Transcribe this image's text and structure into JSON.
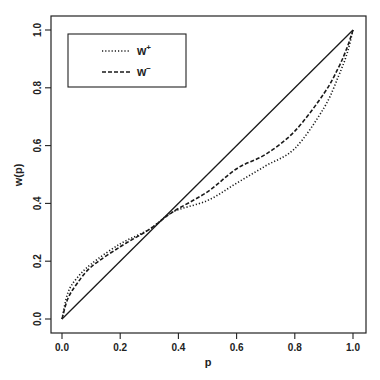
{
  "chart_data": {
    "type": "line",
    "title": "",
    "xlabel": "p",
    "ylabel": "w(p)",
    "xlim": [
      0.0,
      1.0
    ],
    "ylim": [
      0.0,
      1.0
    ],
    "x_ticks": [
      "0.0",
      "0.2",
      "0.4",
      "0.6",
      "0.8",
      "1.0"
    ],
    "y_ticks": [
      "0.0",
      "0.2",
      "0.4",
      "0.6",
      "0.8",
      "1.0"
    ],
    "grid": false,
    "legend_position": "upper-left",
    "x": [
      0.0,
      0.02,
      0.05,
      0.1,
      0.2,
      0.3,
      0.38,
      0.5,
      0.6,
      0.7,
      0.8,
      0.9,
      0.95,
      0.98,
      1.0
    ],
    "series": [
      {
        "name": "diagonal",
        "style": "solid",
        "in_legend": false,
        "values": [
          0.0,
          0.02,
          0.05,
          0.1,
          0.2,
          0.3,
          0.38,
          0.5,
          0.6,
          0.7,
          0.8,
          0.9,
          0.95,
          0.98,
          1.0
        ]
      },
      {
        "name": "w+",
        "style": "dotted",
        "in_legend": true,
        "values": [
          0.0,
          0.09,
          0.14,
          0.19,
          0.26,
          0.31,
          0.37,
          0.41,
          0.47,
          0.53,
          0.59,
          0.73,
          0.84,
          0.92,
          1.0
        ]
      },
      {
        "name": "w-",
        "style": "dashed",
        "in_legend": true,
        "values": [
          0.0,
          0.07,
          0.12,
          0.18,
          0.25,
          0.31,
          0.37,
          0.44,
          0.52,
          0.57,
          0.65,
          0.78,
          0.87,
          0.94,
          1.0
        ]
      }
    ]
  },
  "legend": {
    "items": [
      {
        "base": "w",
        "sup": "+",
        "style": "dotted"
      },
      {
        "base": "w",
        "sup": "−",
        "style": "dashed"
      }
    ]
  },
  "axes": {
    "xlabel": "p",
    "ylabel": "w(p)"
  },
  "colors": {
    "line": "#1a1a1a",
    "frame": "#222222",
    "background": "#ffffff"
  }
}
